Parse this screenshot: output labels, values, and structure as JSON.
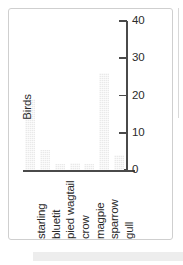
{
  "figure": {
    "frame_color": "#cfcfcf",
    "background": "#ffffff",
    "bar_color": "#e9e9e9",
    "axis_color": "#4a4a4a",
    "text_color": "#2b2b2b"
  },
  "chart_data": {
    "type": "bar",
    "title": "",
    "xlabel": "",
    "ylabel": "Birds",
    "categories": [
      "starling",
      "bluetit",
      "pied wagtail",
      "crow",
      "magpie",
      "sparrow",
      "gull"
    ],
    "values": [
      19,
      5.5,
      1.5,
      2,
      1.5,
      26,
      4
    ],
    "ylim": [
      0,
      40
    ],
    "yticks": [
      0,
      10,
      20,
      30,
      40
    ],
    "ytick_labels": [
      "0",
      "10",
      "20",
      "30",
      "40"
    ],
    "grid": false,
    "legend": "none",
    "y_axis_position": "right",
    "x_tick_label_rotation": 90
  }
}
